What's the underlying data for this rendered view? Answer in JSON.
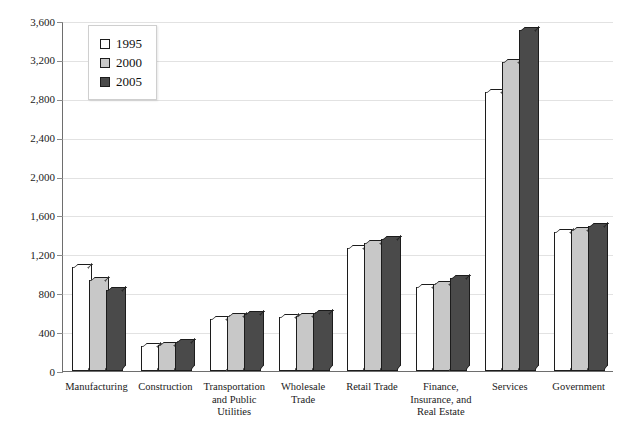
{
  "chart_data": {
    "type": "bar",
    "title": "",
    "xlabel": "",
    "ylabel": "",
    "ylim": [
      0,
      3600
    ],
    "grid": true,
    "legend_position": "top-left",
    "categories": [
      "Manufacturing",
      "Construction",
      "Transportation and Public Utilities",
      "Wholesale Trade",
      "Retail Trade",
      "Finance, Insurance, and Real Estate",
      "Services",
      "Government"
    ],
    "ytick_labels": [
      "0",
      "400",
      "800",
      "1,200",
      "1,600",
      "2,000",
      "2,400",
      "2,800",
      "3,200",
      "3,600"
    ],
    "ytick_values": [
      0,
      400,
      800,
      1200,
      1600,
      2000,
      2400,
      2800,
      3200,
      3600
    ],
    "series": [
      {
        "name": "1995",
        "color": "#ffffff",
        "values": [
          1070,
          260,
          540,
          555,
          1270,
          865,
          2870,
          1430
        ]
      },
      {
        "name": "2000",
        "color": "#c8c8c8",
        "values": [
          940,
          270,
          565,
          570,
          1315,
          900,
          3180,
          1455
        ]
      },
      {
        "name": "2005",
        "color": "#4a4a4a",
        "values": [
          830,
          300,
          590,
          595,
          1360,
          960,
          3510,
          1490
        ]
      }
    ]
  },
  "axis": {
    "y_labels": [
      {
        "label": "3,600",
        "value": 3600
      },
      {
        "label": "3,200",
        "value": 3200
      },
      {
        "label": "2,800",
        "value": 2800
      },
      {
        "label": "2,400",
        "value": 2400
      },
      {
        "label": "2,000",
        "value": 2000
      },
      {
        "label": "1,600",
        "value": 1600
      },
      {
        "label": "1,200",
        "value": 1200
      },
      {
        "label": "800",
        "value": 800
      },
      {
        "label": "400",
        "value": 400
      },
      {
        "label": "0",
        "value": 0
      }
    ]
  },
  "x_categories": [
    {
      "lines": [
        "Manufacturing"
      ]
    },
    {
      "lines": [
        "Construction"
      ]
    },
    {
      "lines": [
        "Transportation",
        "and Public",
        "Utilities"
      ]
    },
    {
      "lines": [
        "Wholesale",
        "Trade"
      ]
    },
    {
      "lines": [
        "Retail Trade"
      ]
    },
    {
      "lines": [
        "Finance,",
        "Insurance, and",
        "Real Estate"
      ]
    },
    {
      "lines": [
        "Services"
      ]
    },
    {
      "lines": [
        "Government"
      ]
    }
  ],
  "legend": {
    "items": [
      {
        "label": "1995",
        "color": "#ffffff"
      },
      {
        "label": "2000",
        "color": "#c8c8c8"
      },
      {
        "label": "2005",
        "color": "#4a4a4a"
      }
    ]
  },
  "title_strip": {
    "text": ""
  }
}
